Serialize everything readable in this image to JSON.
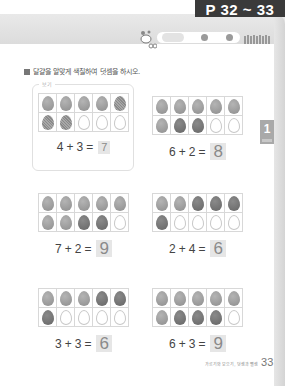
{
  "header": {
    "page_tag": "P 32 ~ 33",
    "pill_label": "",
    "right_decor": ""
  },
  "instruction": "달걀을 알맞게 색칠하여 덧셈을 하시오.",
  "example": {
    "label": "보기",
    "problem": {
      "rows": [
        [
          "light",
          "light",
          "light",
          "light",
          "hatch"
        ],
        [
          "hatch",
          "hatch",
          "empty",
          "empty",
          "empty"
        ]
      ],
      "a": "4",
      "op": "+",
      "b": "3",
      "eq": "=",
      "answer": "7"
    }
  },
  "problems": [
    {
      "rows": [
        [
          "light",
          "light",
          "light",
          "light",
          "light"
        ],
        [
          "light",
          "dark",
          "dark",
          "empty",
          "empty"
        ]
      ],
      "a": "6",
      "op": "+",
      "b": "2",
      "eq": "=",
      "answer": "8"
    },
    {
      "rows": [
        [
          "light",
          "light",
          "light",
          "light",
          "light"
        ],
        [
          "light",
          "light",
          "dark",
          "dark",
          "empty"
        ]
      ],
      "a": "7",
      "op": "+",
      "b": "2",
      "eq": "=",
      "answer": "9"
    },
    {
      "rows": [
        [
          "light",
          "light",
          "dark",
          "dark",
          "dark"
        ],
        [
          "dark",
          "empty",
          "empty",
          "empty",
          "empty"
        ]
      ],
      "a": "2",
      "op": "+",
      "b": "4",
      "eq": "=",
      "answer": "6"
    },
    {
      "rows": [
        [
          "light",
          "light",
          "light",
          "dark",
          "dark"
        ],
        [
          "dark",
          "empty",
          "empty",
          "empty",
          "empty"
        ]
      ],
      "a": "3",
      "op": "+",
      "b": "3",
      "eq": "=",
      "answer": "6"
    },
    {
      "rows": [
        [
          "light",
          "light",
          "light",
          "light",
          "light"
        ],
        [
          "light",
          "dark",
          "dark",
          "dark",
          "empty"
        ]
      ],
      "a": "6",
      "op": "+",
      "b": "3",
      "eq": "=",
      "answer": "9"
    }
  ],
  "chapter_tab": "1",
  "footer": {
    "caption": "가르기와 모으기, 덧셈과 뺄셈",
    "page_number": "33"
  }
}
